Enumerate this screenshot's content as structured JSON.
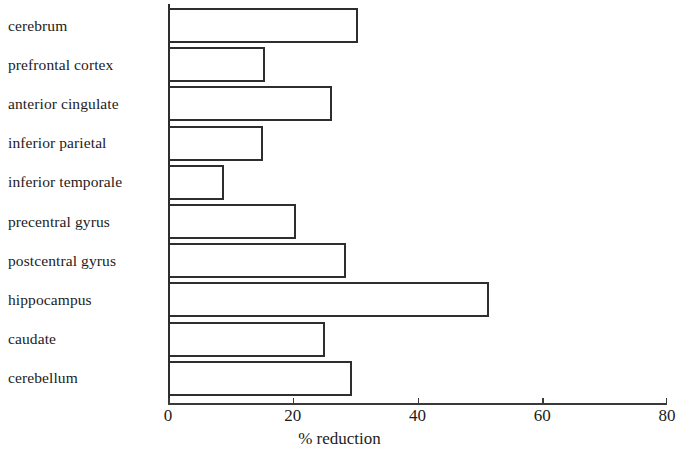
{
  "chart_data": {
    "type": "bar",
    "orientation": "horizontal",
    "title": "",
    "subtitle": "",
    "xlabel": "% reduction",
    "ylabel": "",
    "xlim": [
      0,
      80
    ],
    "xticks": [
      0,
      20,
      40,
      60,
      80
    ],
    "xtick_labels": [
      "0",
      "20",
      "40",
      "60",
      "80"
    ],
    "grid": false,
    "legend": false,
    "legend_position": "none",
    "bar_fill_color": "#ffffff",
    "bar_edge_color": "#2e2e2e",
    "categories": [
      "cerebrum",
      "prefrontal cortex",
      "anterior cingulate",
      "inferior parietal",
      "inferior temporale",
      "precentral gyrus",
      "postcentral gyrus",
      "hippocampus",
      "caudate",
      "cerebellum"
    ],
    "values": [
      30.5,
      15.5,
      26.3,
      15.3,
      9.0,
      20.5,
      28.5,
      51.5,
      25.2,
      29.5
    ]
  }
}
